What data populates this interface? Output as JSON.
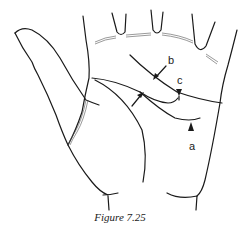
{
  "figure": {
    "caption": "Figure 7.25",
    "labels": {
      "a": "a",
      "b": "b",
      "c": "c"
    }
  }
}
